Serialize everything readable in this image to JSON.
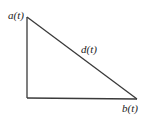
{
  "diagram": {
    "type": "right-triangle",
    "labels": {
      "top_vertex": "a(t)",
      "hypotenuse": "d(t)",
      "right_vertex": "b(t)"
    },
    "colors": {
      "stroke": "#3a3a3a",
      "text": "#222222",
      "background": "#ffffff"
    }
  }
}
